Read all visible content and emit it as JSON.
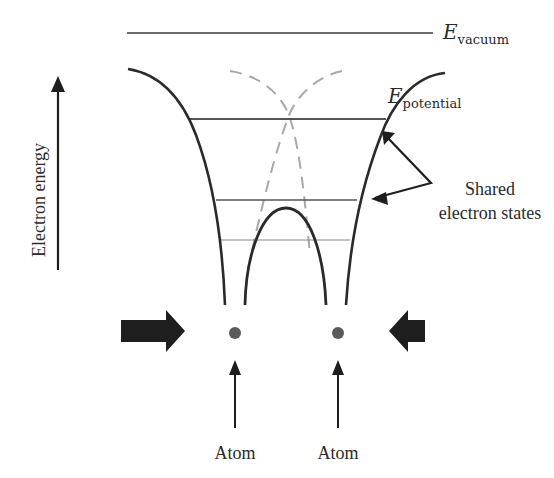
{
  "diagram": {
    "axis": {
      "label": "Electron energy",
      "direction": "up"
    },
    "levels": {
      "vacuum": {
        "symbol": "E",
        "subscript": "vacuum"
      },
      "potential": {
        "symbol": "E",
        "subscript": "potential"
      }
    },
    "annotations": {
      "shared_line1": "Shared",
      "shared_line2": "electron states",
      "atom_left": "Atom",
      "atom_right": "Atom"
    },
    "colors": {
      "line": "#2a2a2a",
      "dashed": "#a8a8a8",
      "level": "#555555",
      "atom": "#5a5a5a",
      "arrow": "#1e1e1e"
    },
    "elements": [
      "vacuum-level-line",
      "left-potential-well-curve",
      "right-potential-well-curve",
      "central-barrier-curve",
      "isolated-atom-dashed-curves",
      "shared-energy-level-lines",
      "compression-arrows",
      "atom-dots"
    ]
  }
}
